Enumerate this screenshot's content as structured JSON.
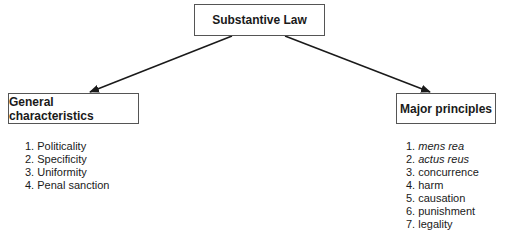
{
  "diagram": {
    "root": {
      "label": "Substantive Law"
    },
    "left": {
      "label": "General characteristics",
      "items": [
        {
          "num": "1.",
          "text": "Politicality",
          "italic": false
        },
        {
          "num": "2.",
          "text": "Specificity",
          "italic": false
        },
        {
          "num": "3.",
          "text": "Uniformity",
          "italic": false
        },
        {
          "num": "4.",
          "text": "Penal sanction",
          "italic": false
        }
      ]
    },
    "right": {
      "label": "Major principles",
      "items": [
        {
          "num": "1.",
          "text": "mens rea",
          "italic": true
        },
        {
          "num": "2.",
          "text": "actus reus",
          "italic": true
        },
        {
          "num": "3.",
          "text": "concurrence",
          "italic": false
        },
        {
          "num": "4.",
          "text": "harm",
          "italic": false
        },
        {
          "num": "5.",
          "text": "causation",
          "italic": false
        },
        {
          "num": "6.",
          "text": "punishment",
          "italic": false
        },
        {
          "num": "7.",
          "text": "legality",
          "italic": false
        }
      ]
    },
    "colors": {
      "line": "#1a1a1a",
      "border": "#555555"
    }
  }
}
